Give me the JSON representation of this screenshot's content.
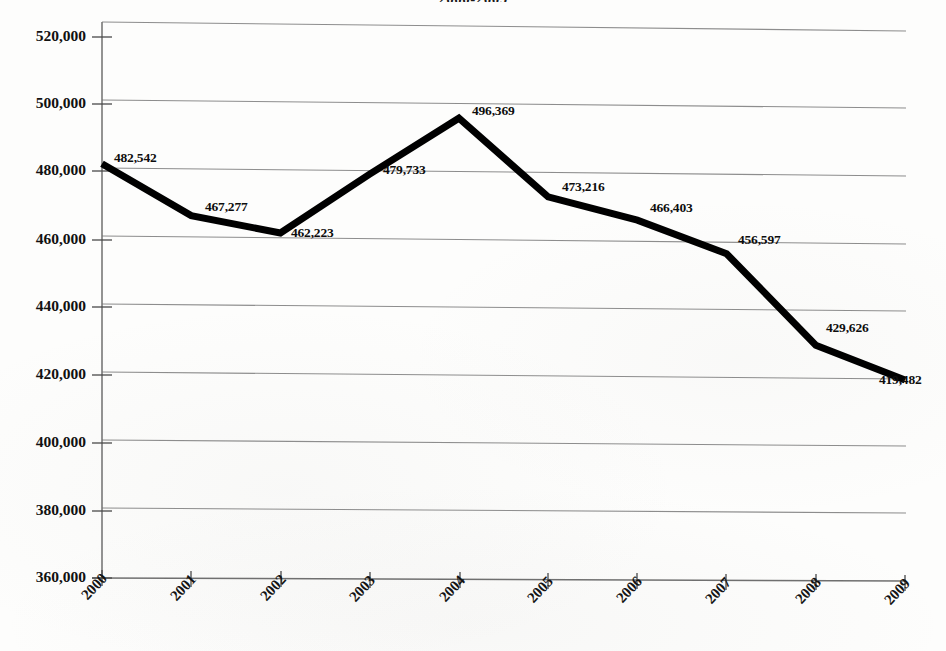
{
  "chart_data": {
    "type": "line",
    "title": "2000-2009",
    "xlabel": "",
    "ylabel": "",
    "categories": [
      "2000",
      "2001",
      "2002",
      "2003",
      "2004",
      "2005",
      "2006",
      "2007",
      "2008",
      "2009"
    ],
    "values": [
      482542,
      467277,
      462223,
      479733,
      496369,
      473216,
      466403,
      456597,
      429626,
      419482
    ],
    "point_labels": [
      "482,542",
      "467,277",
      "462,223",
      "479,733",
      "496,369",
      "473,216",
      "466,403",
      "456,597",
      "429,626",
      "419,482"
    ],
    "ytick_labels": [
      "360,000",
      "380,000",
      "400,000",
      "420,000",
      "440,000",
      "460,000",
      "480,000",
      "500,000",
      "520,000"
    ],
    "ytick_values": [
      360000,
      380000,
      400000,
      420000,
      440000,
      460000,
      480000,
      500000,
      520000
    ],
    "ylim": [
      360000,
      520000
    ],
    "grid": true,
    "legend": false,
    "series": [
      {
        "name": "",
        "values": [
          482542,
          467277,
          462223,
          479733,
          496369,
          473216,
          466403,
          456597,
          429626,
          419482
        ],
        "color": "#000000",
        "line_width": 7
      }
    ]
  },
  "colors": {
    "line": "#000000",
    "grid": "#8d8d8d",
    "axis": "#6f6f6f",
    "text": "#111111",
    "background": "#fdfdfc"
  }
}
